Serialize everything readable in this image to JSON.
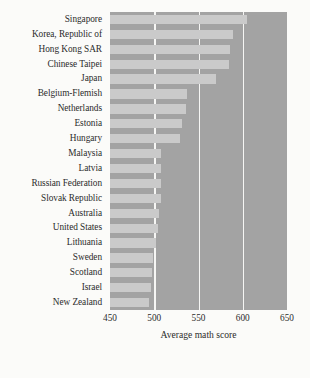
{
  "chart_data": {
    "type": "bar",
    "orientation": "horizontal",
    "title": "",
    "xlabel": "Average math score",
    "ylabel": "",
    "xlim": [
      450,
      650
    ],
    "xticks": [
      450,
      500,
      550,
      600,
      650
    ],
    "xtick_labels": [
      "450",
      "500",
      "550",
      "600",
      "650"
    ],
    "grid": true,
    "gridlines_at": [
      500,
      550,
      600
    ],
    "legend": "none",
    "bar_color": "#cacaca",
    "panel_color": "#a3a3a3",
    "gridline_color": "#f6f6f4",
    "background_color": "#fbfbf9",
    "text_color": "#2b2b2b",
    "categories": [
      "Singapore",
      "Korea, Republic of",
      "Hong Kong SAR",
      "Chinese Taipei",
      "Japan",
      "Belgium-Flemish",
      "Netherlands",
      "Estonia",
      "Hungary",
      "Malaysia",
      "Latvia",
      "Russian Federation",
      "Slovak Republic",
      "Australia",
      "United States",
      "Lithuania",
      "Sweden",
      "Scotland",
      "Israel",
      "New Zealand"
    ],
    "values": [
      605,
      589,
      586,
      585,
      570,
      537,
      536,
      531,
      529,
      508,
      508,
      508,
      508,
      505,
      504,
      502,
      499,
      498,
      496,
      494
    ]
  },
  "axis": {
    "x_title": "Average math score"
  }
}
